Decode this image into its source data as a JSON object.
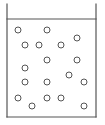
{
  "diagram": {
    "type": "container-with-particles",
    "container": {
      "left_x": 7,
      "right_x": 96,
      "top_y": 4,
      "bottom_y": 117,
      "liquid_level_y": 19,
      "stroke_color": "#555555",
      "stroke_width": 1.2
    },
    "particle_style": {
      "radius": 3,
      "stroke_color": "#555555",
      "stroke_width": 1,
      "fill": "#ffffff"
    },
    "particles": [
      {
        "x": 18,
        "y": 30
      },
      {
        "x": 47,
        "y": 30
      },
      {
        "x": 77,
        "y": 38
      },
      {
        "x": 25,
        "y": 45
      },
      {
        "x": 39,
        "y": 45
      },
      {
        "x": 61,
        "y": 45
      },
      {
        "x": 47,
        "y": 60
      },
      {
        "x": 77,
        "y": 60
      },
      {
        "x": 25,
        "y": 68
      },
      {
        "x": 69,
        "y": 75
      },
      {
        "x": 25,
        "y": 82
      },
      {
        "x": 47,
        "y": 82
      },
      {
        "x": 84,
        "y": 82
      },
      {
        "x": 18,
        "y": 98
      },
      {
        "x": 47,
        "y": 98
      },
      {
        "x": 61,
        "y": 98
      },
      {
        "x": 32,
        "y": 106
      },
      {
        "x": 84,
        "y": 106
      }
    ]
  }
}
